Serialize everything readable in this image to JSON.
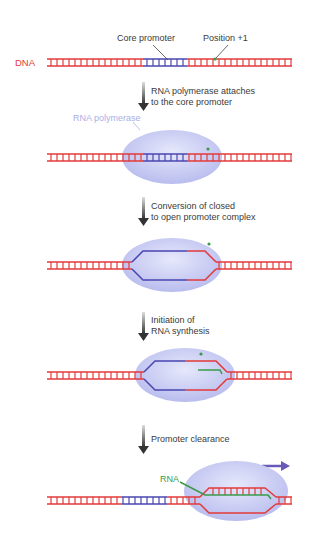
{
  "labels": {
    "dna": "DNA",
    "core_promoter": "Core promoter",
    "position": "Position +1",
    "rna_polymerase": "RNA polymerase",
    "rna": "RNA"
  },
  "steps": [
    {
      "line1": "RNA polymerase attaches",
      "line2": "to the core promoter"
    },
    {
      "line1": "Conversion of closed",
      "line2": "to open promoter complex"
    },
    {
      "line1": "Initiation of",
      "line2": "RNA synthesis"
    },
    {
      "line1": "Promoter clearance",
      "line2": ""
    }
  ],
  "colors": {
    "dna": "#e23a3a",
    "promoter": "#4a46b0",
    "rna": "#3a9a4a",
    "polymerase": "#c9cdf2",
    "arrow": "#444444",
    "direction_arrow": "#6a5ab8"
  }
}
